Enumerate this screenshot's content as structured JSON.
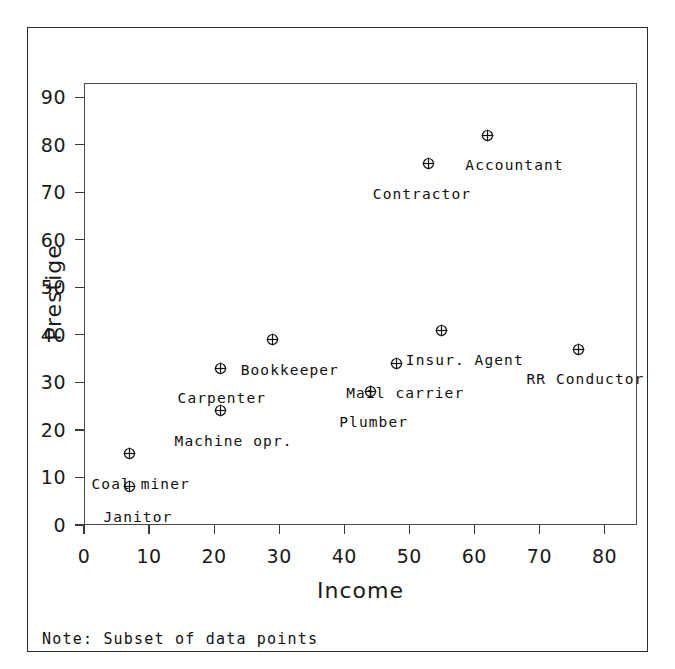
{
  "figure": {
    "note": "Note: Subset of data points"
  },
  "chart_data": {
    "type": "scatter",
    "title": "",
    "xlabel": "Income",
    "ylabel": "Prestige",
    "xlim": [
      0,
      85
    ],
    "ylim": [
      0,
      93
    ],
    "xticks": [
      0,
      10,
      20,
      30,
      40,
      50,
      60,
      70,
      80
    ],
    "xticklabels": [
      "0",
      "10",
      "20",
      "30",
      "40",
      "50",
      "60",
      "70",
      "80"
    ],
    "yticks": [
      0,
      10,
      20,
      30,
      40,
      50,
      60,
      70,
      80,
      90
    ],
    "yticklabels": [
      "0",
      "10",
      "20",
      "30",
      "40",
      "50",
      "60",
      "70",
      "80",
      "90"
    ],
    "grid": false,
    "legend": "none",
    "marker": "circle-plus",
    "marker_color": "#111111",
    "points": [
      {
        "label": "Janitor",
        "x": 7,
        "y": 8,
        "label_dx": -26,
        "label_dy": 22
      },
      {
        "label": "Coal miner",
        "x": 7,
        "y": 15,
        "label_dx": -38,
        "label_dy": 22
      },
      {
        "label": "Machine opr.",
        "x": 21,
        "y": 24,
        "label_dx": -46,
        "label_dy": 22
      },
      {
        "label": "Carpenter",
        "x": 21,
        "y": 33,
        "label_dx": -43,
        "label_dy": 22
      },
      {
        "label": "Bookkeeper",
        "x": 29,
        "y": 39,
        "label_dx": -32,
        "label_dy": 22
      },
      {
        "label": "Plumber",
        "x": 44,
        "y": 28,
        "label_dx": -31,
        "label_dy": 22
      },
      {
        "label": "Mail carrier",
        "x": 48,
        "y": 34,
        "label_dx": -50,
        "label_dy": 22
      },
      {
        "label": "Insur. Agent",
        "x": 55,
        "y": 41,
        "label_dx": -36,
        "label_dy": 22
      },
      {
        "label": "Contractor",
        "x": 53,
        "y": 76,
        "label_dx": -56,
        "label_dy": 22
      },
      {
        "label": "Accountant",
        "x": 62,
        "y": 82,
        "label_dx": -22,
        "label_dy": 22
      },
      {
        "label": "RR Conductor",
        "x": 76,
        "y": 37,
        "label_dx": -52,
        "label_dy": 22
      }
    ]
  }
}
